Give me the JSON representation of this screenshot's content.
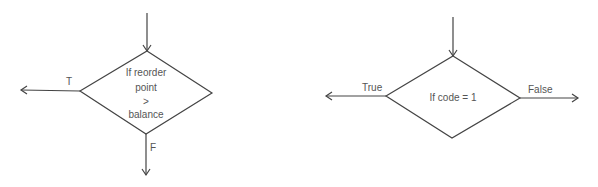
{
  "diagram_left": {
    "condition_lines": [
      "If reorder",
      "point",
      ">",
      "balance"
    ],
    "true_label": "T",
    "false_label": "F"
  },
  "diagram_right": {
    "condition": "If code = 1",
    "true_label": "True",
    "false_label": "False"
  },
  "colors": {
    "stroke": "#444444",
    "text": "#555555",
    "background": "#ffffff"
  }
}
